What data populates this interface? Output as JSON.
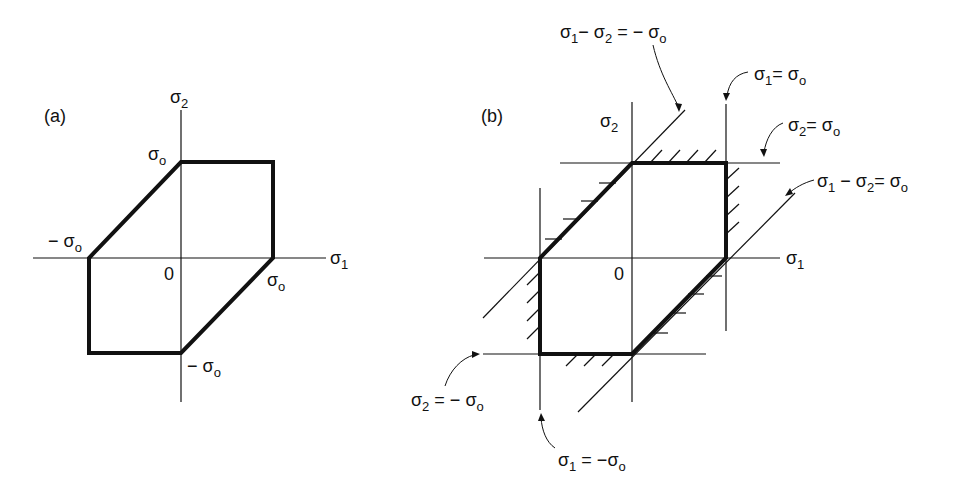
{
  "diagram_a": {
    "panel_label": "(a)",
    "axis_x_label": "σ",
    "axis_x_sub": "1",
    "axis_y_label": "σ",
    "axis_y_sub": "2",
    "origin_label": "0",
    "top_label": "σ",
    "top_sub": "o",
    "left_label": "− σ",
    "left_sub": "o",
    "right_label": "σ",
    "right_sub": "o",
    "bottom_label": "− σ",
    "bottom_sub": "o"
  },
  "diagram_b": {
    "panel_label": "(b)",
    "axis_x_label": "σ",
    "axis_x_sub": "1",
    "axis_y_label": "σ",
    "axis_y_sub": "2",
    "origin_label": "0",
    "ann_diag_upper": {
      "a": "σ",
      "a_sub": "1",
      "mid": "− σ",
      "mid_sub": "2",
      "eq": "= − σ",
      "eq_sub": "o"
    },
    "ann_s1_pos": {
      "a": "σ",
      "a_sub": "1",
      "eq": "= σ",
      "eq_sub": "o"
    },
    "ann_s2_pos": {
      "a": "σ",
      "a_sub": "2",
      "eq": "= σ",
      "eq_sub": "o"
    },
    "ann_diag_lower": {
      "a": "σ",
      "a_sub": "1",
      "mid": "− σ",
      "mid_sub": "2",
      "eq": "= σ",
      "eq_sub": "o"
    },
    "ann_s2_neg": {
      "a": "σ",
      "a_sub": "2",
      "eq": "= − σ",
      "eq_sub": "o"
    },
    "ann_s1_neg": {
      "a": "σ",
      "a_sub": "1",
      "eq": "= −σ",
      "eq_sub": "o"
    }
  }
}
